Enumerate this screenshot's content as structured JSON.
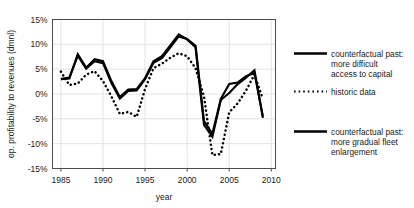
{
  "chart_data": {
    "type": "line",
    "title": "",
    "xlabel": "year",
    "ylabel": "op. profitability to revenues (dmnl)",
    "xlim": [
      1984,
      2010.5
    ],
    "ylim": [
      -15,
      15
    ],
    "xticks": [
      1985,
      1990,
      1995,
      2000,
      2005,
      2010
    ],
    "xticklabels": [
      "1985",
      "1990",
      "1995",
      "2000",
      "2005",
      "2010"
    ],
    "yticks": [
      -15,
      -10,
      -5,
      0,
      5,
      10,
      15
    ],
    "yticklabels": [
      "-15%",
      "-10%",
      "-5%",
      "0%",
      "5%",
      "10%",
      "15%"
    ],
    "grid": true,
    "legend_position": "right",
    "x": [
      1985,
      1986,
      1987,
      1988,
      1989,
      1990,
      1991,
      1992,
      1993,
      1994,
      1995,
      1996,
      1997,
      1998,
      1999,
      2000,
      2001,
      2002,
      2003,
      2004,
      2005,
      2006,
      2007,
      2008,
      2009
    ],
    "series": [
      {
        "name": "counterfactual past: more difficult access to capital",
        "style": "solid",
        "values": [
          3.0,
          3.1,
          8.0,
          5.3,
          7.0,
          6.6,
          2.6,
          -0.6,
          0.9,
          1.0,
          3.2,
          6.6,
          7.6,
          9.8,
          12.0,
          11.0,
          9.4,
          -6.2,
          -8.6,
          -1.2,
          0.2,
          2.0,
          3.3,
          4.8,
          -4.8
        ]
      },
      {
        "name": "historic data",
        "style": "dotted",
        "values": [
          4.5,
          1.8,
          2.1,
          3.9,
          4.6,
          2.6,
          -0.5,
          -4.0,
          -3.6,
          -4.6,
          1.0,
          5.2,
          6.1,
          7.3,
          8.2,
          7.6,
          5.2,
          -0.5,
          -12.3,
          -12.1,
          -3.7,
          -1.9,
          0.7,
          3.9,
          -1.0
        ]
      },
      {
        "name": "counterfactual past: more gradual fleet enlargement",
        "style": "solid",
        "values": [
          3.0,
          3.3,
          7.7,
          5.1,
          6.6,
          6.2,
          2.2,
          -0.9,
          0.6,
          0.7,
          3.0,
          6.3,
          7.2,
          9.4,
          11.6,
          11.1,
          9.7,
          -5.4,
          -8.0,
          -1.0,
          2.0,
          2.3,
          3.6,
          4.2,
          -4.5
        ]
      }
    ]
  },
  "legend": {
    "items": [
      {
        "marker": "solid-line-swatch",
        "lines": [
          "counterfactual past:",
          "more difficult",
          "access to capital"
        ]
      },
      {
        "marker": "dotted-line-swatch",
        "lines": [
          "historic data"
        ]
      },
      {
        "marker": "solid-line-swatch",
        "lines": [
          "counterfactual past:",
          "more gradual fleet",
          "enlargement"
        ]
      }
    ],
    "item0_line0": "counterfactual past:",
    "item0_line1": "more difficult",
    "item0_line2": "access to capital",
    "item1_line0": "historic data",
    "item2_line0": "counterfactual past:",
    "item2_line1": "more gradual fleet",
    "item2_line2": "enlargement"
  },
  "axis": {
    "y_title": "op. profitability to revenues (dmnl)",
    "x_title": "year",
    "ytick_0": "15%",
    "ytick_1": "10%",
    "ytick_2": "5%",
    "ytick_3": "0%",
    "ytick_4": "-5%",
    "ytick_5": "-10%",
    "ytick_6": "-15%",
    "xtick_0": "1985",
    "xtick_1": "1990",
    "xtick_2": "1995",
    "xtick_3": "2000",
    "xtick_4": "2005",
    "xtick_5": "2010"
  },
  "colors": {
    "line": "#000000",
    "grid": "#e2e2e2",
    "frame": "#4d4d4d",
    "background": "#ffffff"
  }
}
